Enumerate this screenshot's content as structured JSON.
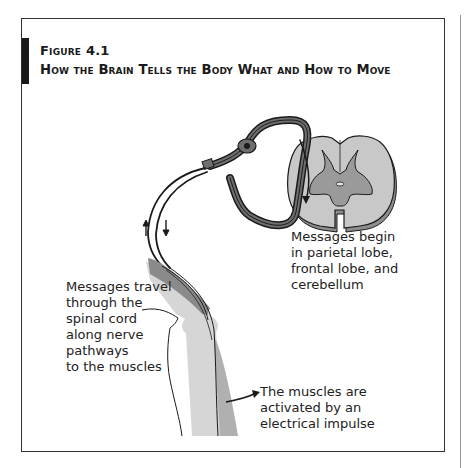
{
  "figure": {
    "label": "Figure 4.1",
    "title": "How the Brain Tells the Body What and How to Move"
  },
  "captions": {
    "messages_begin": "Messages begin\nin parietal lobe,\nfrontal lobe, and\ncerebellum",
    "messages_travel": "Messages travel\nthrough the\nspinal cord\nalong nerve\npathways\nto the muscles",
    "muscles_activated": "The muscles are\nactivated by an\nelectrical impulse"
  },
  "diagram": {
    "elements": [
      "spinal-cord-cross-section",
      "nerve-pathway-loop",
      "ganglion",
      "leg-knee",
      "thigh-muscle",
      "signal-arrows"
    ],
    "colors": {
      "outline": "#1a1a1a",
      "white_matter": "#c8c8c8",
      "gray_matter": "#9a9a9a",
      "nerve_sheath": "#6e6e6e",
      "bone": "#d6d6d6",
      "muscle": "#b0b0b0"
    }
  }
}
